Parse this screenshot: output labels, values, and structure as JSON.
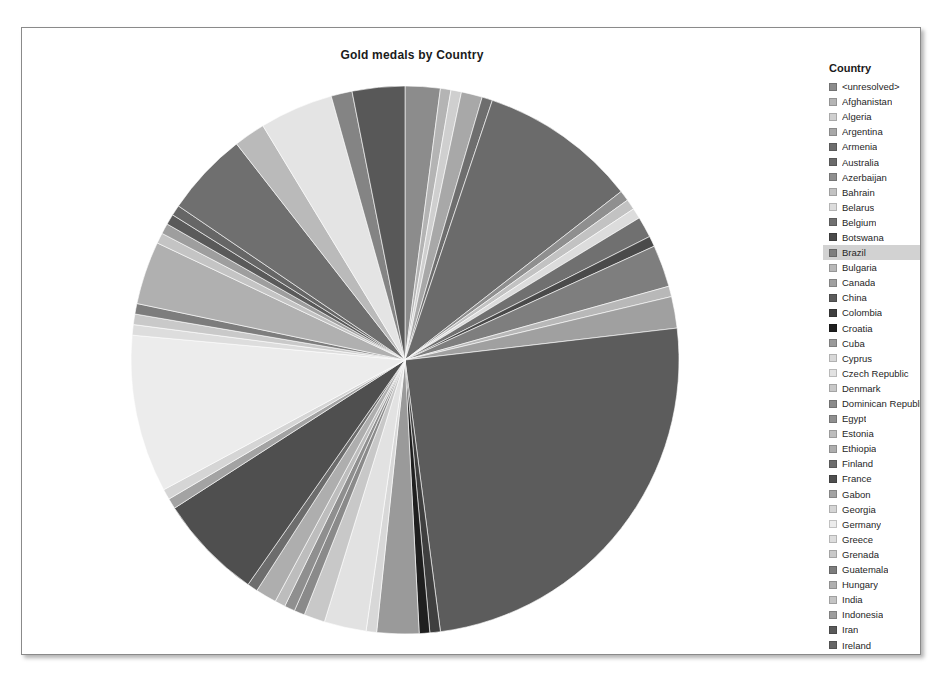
{
  "chart_title": "Gold medals by Country",
  "legend": {
    "title": "Country",
    "highlighted_item": "Brazil",
    "clipped_last_item": true
  },
  "colors": {
    "frame_border": "#8a8a8a",
    "background": "#ffffff",
    "title_text": "#1b1b1b",
    "legend_text": "#262626",
    "highlight_row": "#d2d2d2"
  },
  "chart_data": {
    "type": "pie",
    "title": "Gold medals by Country",
    "xlabel": "",
    "ylabel": "",
    "legend_position": "right",
    "grid": false,
    "start_angle_deg": -90,
    "direction": "clockwise",
    "categories": [
      "<unresolved>",
      "Afghanistan",
      "Algeria",
      "Argentina",
      "Armenia",
      "Australia",
      "Azerbaijan",
      "Bahrain",
      "Belarus",
      "Belgium",
      "Botswana",
      "Brazil",
      "Bulgaria",
      "Canada",
      "China",
      "Colombia",
      "Croatia",
      "Cuba",
      "Cyprus",
      "Czech Republic",
      "Denmark",
      "Dominican Republic",
      "Egypt",
      "Estonia",
      "Ethiopia",
      "Finland",
      "France",
      "Gabon",
      "Georgia",
      "Germany",
      "Greece",
      "Grenada",
      "Guatemala",
      "Hungary",
      "India",
      "Indonesia",
      "Iran",
      "Ireland",
      "Italy",
      "Jamaica",
      "Japan",
      "Kazakhstan",
      "Kenya"
    ],
    "values": [
      2.0,
      0.6,
      0.6,
      1.2,
      0.6,
      9.0,
      0.6,
      0.6,
      0.6,
      1.2,
      0.6,
      2.4,
      0.6,
      1.8,
      24.0,
      0.6,
      0.6,
      2.4,
      0.6,
      2.4,
      1.2,
      0.6,
      0.6,
      0.6,
      1.2,
      0.6,
      6.0,
      0.6,
      0.6,
      9.0,
      0.6,
      0.6,
      0.6,
      3.6,
      0.6,
      0.6,
      0.6,
      0.6,
      4.8,
      1.8,
      4.2,
      1.2,
      3.0
    ],
    "slice_colors": [
      "#8c8c8c",
      "#b4b4b4",
      "#cfcfcf",
      "#a8a8a8",
      "#6e6e6e",
      "#6b6b6b",
      "#8f8f8f",
      "#c2c2c2",
      "#dcdcdc",
      "#707070",
      "#4a4a4a",
      "#7e7e7e",
      "#b8b8b8",
      "#a0a0a0",
      "#5c5c5c",
      "#3f3f3f",
      "#1f1f1f",
      "#9a9a9a",
      "#d8d8d8",
      "#e2e2e2",
      "#c8c8c8",
      "#8a8a8a",
      "#8f8f8f",
      "#bdbdbd",
      "#aeaeae",
      "#6d6d6d",
      "#4f4f4f",
      "#a3a3a3",
      "#d5d5d5",
      "#ececec",
      "#dddddd",
      "#c9c9c9",
      "#7d7d7d",
      "#b0b0b0",
      "#c4c4c4",
      "#9e9e9e",
      "#5a5a5a",
      "#666666",
      "#6f6f6f",
      "#bababa",
      "#e4e4e4",
      "#848484",
      "#585858"
    ]
  },
  "legend_items": [
    {
      "label": "<unresolved>",
      "color": "#8c8c8c"
    },
    {
      "label": "Afghanistan",
      "color": "#b4b4b4"
    },
    {
      "label": "Algeria",
      "color": "#cfcfcf"
    },
    {
      "label": "Argentina",
      "color": "#a8a8a8"
    },
    {
      "label": "Armenia",
      "color": "#6e6e6e"
    },
    {
      "label": "Australia",
      "color": "#6b6b6b"
    },
    {
      "label": "Azerbaijan",
      "color": "#8f8f8f"
    },
    {
      "label": "Bahrain",
      "color": "#c2c2c2"
    },
    {
      "label": "Belarus",
      "color": "#dcdcdc"
    },
    {
      "label": "Belgium",
      "color": "#707070"
    },
    {
      "label": "Botswana",
      "color": "#4a4a4a"
    },
    {
      "label": "Brazil",
      "color": "#7e7e7e"
    },
    {
      "label": "Bulgaria",
      "color": "#b8b8b8"
    },
    {
      "label": "Canada",
      "color": "#a0a0a0"
    },
    {
      "label": "China",
      "color": "#5c5c5c"
    },
    {
      "label": "Colombia",
      "color": "#3f3f3f"
    },
    {
      "label": "Croatia",
      "color": "#1f1f1f"
    },
    {
      "label": "Cuba",
      "color": "#9a9a9a"
    },
    {
      "label": "Cyprus",
      "color": "#d8d8d8"
    },
    {
      "label": "Czech Republic",
      "color": "#e2e2e2"
    },
    {
      "label": "Denmark",
      "color": "#c8c8c8"
    },
    {
      "label": "Dominican Republic",
      "color": "#8a8a8a"
    },
    {
      "label": "Egypt",
      "color": "#8f8f8f"
    },
    {
      "label": "Estonia",
      "color": "#bdbdbd"
    },
    {
      "label": "Ethiopia",
      "color": "#aeaeae"
    },
    {
      "label": "Finland",
      "color": "#6d6d6d"
    },
    {
      "label": "France",
      "color": "#4f4f4f"
    },
    {
      "label": "Gabon",
      "color": "#a3a3a3"
    },
    {
      "label": "Georgia",
      "color": "#d5d5d5"
    },
    {
      "label": "Germany",
      "color": "#ececec"
    },
    {
      "label": "Greece",
      "color": "#dddddd"
    },
    {
      "label": "Grenada",
      "color": "#c9c9c9"
    },
    {
      "label": "Guatemala",
      "color": "#7d7d7d"
    },
    {
      "label": "Hungary",
      "color": "#b0b0b0"
    },
    {
      "label": "India",
      "color": "#c4c4c4"
    },
    {
      "label": "Indonesia",
      "color": "#9e9e9e"
    },
    {
      "label": "Iran",
      "color": "#5a5a5a"
    },
    {
      "label": "Ireland",
      "color": "#666666"
    },
    {
      "label": "Italy",
      "color": "#6f6f6f"
    },
    {
      "label": "Jamaica",
      "color": "#bababa"
    },
    {
      "label": "Japan",
      "color": "#e4e4e4"
    },
    {
      "label": "Kazakhstan",
      "color": "#848484"
    },
    {
      "label": "Kenya",
      "color": "#585858"
    },
    {
      "label": "",
      "color": "#9c9c9c"
    }
  ]
}
